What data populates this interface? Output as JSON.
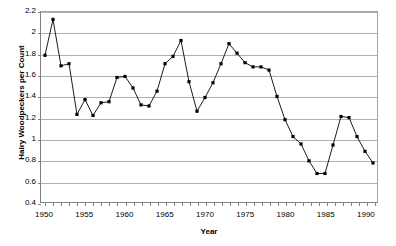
{
  "chart_data": {
    "type": "line",
    "title": "",
    "xlabel": "Year",
    "ylabel": "Hairy Woodpeckers per Count",
    "xlim": [
      1949.5,
      1991.5
    ],
    "ylim": [
      0.4,
      2.2
    ],
    "grid": true,
    "legend": false,
    "marker": "square",
    "marker_color": "#000000",
    "line_color": "#000000",
    "y_ticks": [
      0.4,
      0.6,
      0.8,
      1,
      1.2,
      1.4,
      1.6,
      1.8,
      2,
      2.2
    ],
    "y_tick_labels": [
      "0.4",
      "0.6",
      "0.8",
      "1",
      "1.2",
      "1.4",
      "1.6",
      "1.8",
      "2",
      "2.2"
    ],
    "x_ticks": [
      1950,
      1951,
      1952,
      1953,
      1954,
      1955,
      1956,
      1957,
      1958,
      1959,
      1960,
      1961,
      1962,
      1963,
      1964,
      1965,
      1966,
      1967,
      1968,
      1969,
      1970,
      1971,
      1972,
      1973,
      1974,
      1975,
      1976,
      1977,
      1978,
      1979,
      1980,
      1981,
      1982,
      1983,
      1984,
      1985,
      1986,
      1987,
      1988,
      1989,
      1990,
      1991
    ],
    "x_tick_labels": [
      {
        "value": 1950,
        "label": "1950"
      },
      {
        "value": 1955,
        "label": "1955"
      },
      {
        "value": 1960,
        "label": "1960"
      },
      {
        "value": 1965,
        "label": "1965"
      },
      {
        "value": 1970,
        "label": "1970"
      },
      {
        "value": 1975,
        "label": "1975"
      },
      {
        "value": 1980,
        "label": "1980"
      },
      {
        "value": 1985,
        "label": "1985"
      },
      {
        "value": 1990,
        "label": "1990"
      }
    ],
    "x": [
      1950,
      1951,
      1952,
      1953,
      1954,
      1955,
      1956,
      1957,
      1958,
      1959,
      1960,
      1961,
      1962,
      1963,
      1964,
      1965,
      1966,
      1967,
      1968,
      1969,
      1970,
      1971,
      1972,
      1973,
      1974,
      1975,
      1976,
      1977,
      1978,
      1979,
      1980,
      1981,
      1982,
      1983,
      1984,
      1985,
      1986,
      1987,
      1988,
      1989,
      1990,
      1991
    ],
    "values": [
      1.79,
      2.13,
      1.69,
      1.71,
      1.23,
      1.37,
      1.22,
      1.34,
      1.35,
      1.58,
      1.59,
      1.48,
      1.32,
      1.31,
      1.45,
      1.71,
      1.78,
      1.93,
      1.54,
      1.26,
      1.39,
      1.53,
      1.71,
      1.9,
      1.81,
      1.72,
      1.68,
      1.68,
      1.65,
      1.4,
      1.18,
      1.02,
      0.95,
      0.79,
      0.67,
      0.67,
      0.94,
      1.21,
      1.2,
      1.02,
      0.88,
      0.77
    ],
    "series": [
      {
        "name": "Hairy Woodpeckers per Count",
        "values": [
          1.79,
          2.13,
          1.69,
          1.71,
          1.23,
          1.37,
          1.22,
          1.34,
          1.35,
          1.58,
          1.59,
          1.48,
          1.32,
          1.31,
          1.45,
          1.71,
          1.78,
          1.93,
          1.54,
          1.26,
          1.39,
          1.53,
          1.71,
          1.9,
          1.81,
          1.72,
          1.68,
          1.68,
          1.65,
          1.4,
          1.18,
          1.02,
          0.95,
          0.79,
          0.67,
          0.67,
          0.94,
          1.21,
          1.2,
          1.02,
          0.88,
          0.77
        ]
      }
    ]
  }
}
